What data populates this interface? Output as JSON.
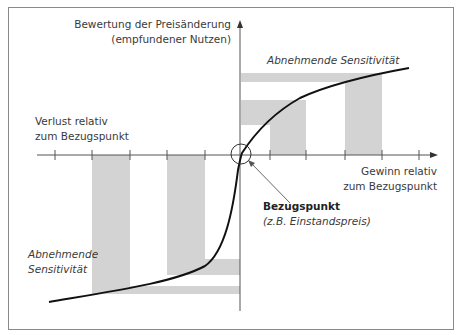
{
  "diagram": {
    "y_axis_label_line1": "Bewertung der Preisänderung",
    "y_axis_label_line2": "(empfundener Nutzen)",
    "upper_annotation": "Abnehmende Sensitivität",
    "loss_label_line1": "Verlust relativ",
    "loss_label_line2": "zum Bezugspunkt",
    "gain_label_line1": "Gewinn relativ",
    "gain_label_line2": "zum Bezugspunkt",
    "reference_title": "Bezugspunkt",
    "reference_example": "(z.B. Einstandspreis)",
    "lower_annotation_line1": "Abnehmende",
    "lower_annotation_line2": "Sensitivität",
    "colors": {
      "band": "#d3d3d3",
      "curve": "#111111",
      "axis": "#555555",
      "border": "#8a8a8a"
    }
  }
}
